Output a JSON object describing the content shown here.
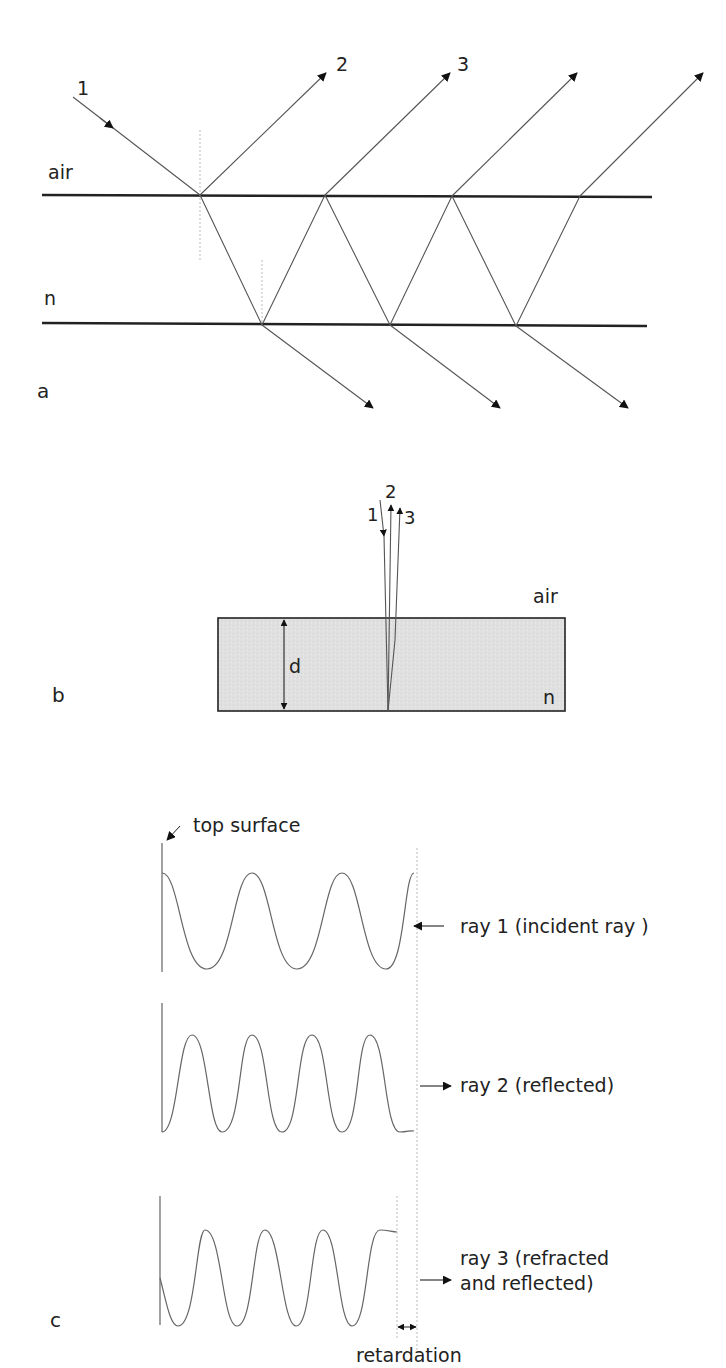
{
  "panel_a": {
    "label": "a",
    "medium_top": "air",
    "medium_film": "n",
    "ray_labels": [
      "1",
      "2",
      "3"
    ]
  },
  "panel_b": {
    "label": "b",
    "medium_top": "air",
    "medium_film": "n",
    "thickness_label": "d",
    "ray_labels": [
      "1",
      "2",
      "3"
    ]
  },
  "panel_c": {
    "label": "c",
    "top_surface_label": "top surface",
    "rays": [
      {
        "label": "ray 1 (incident ray )",
        "direction": "incoming"
      },
      {
        "label": "ray 2 (reflected)",
        "direction": "outgoing"
      },
      {
        "label_line1": "ray 3 (refracted",
        "label_line2": "and reflected)",
        "direction": "outgoing"
      }
    ],
    "retardation_label": "retardation"
  },
  "colors": {
    "film_fill": "#e2e2e2",
    "line": "#222222",
    "ray": "#555555"
  }
}
